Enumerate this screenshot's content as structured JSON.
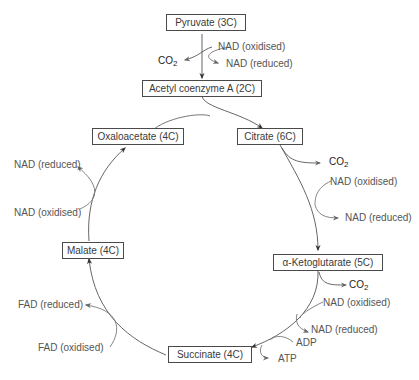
{
  "diagram": {
    "nodes": {
      "pyruvate": "Pyruvate (3C)",
      "acetyl_coa": "Acetyl coenzyme A (2C)",
      "citrate": "Citrate (6C)",
      "ketoglutarate": "α-Ketoglutarate (5C)",
      "succinate": "Succinate (4C)",
      "malate": "Malate (4C)",
      "oxaloacetate": "Oxaloacetate (4C)"
    },
    "labels": {
      "pyr_nad_ox": "NAD (oxidised)",
      "pyr_nad_red": "NAD (reduced)",
      "pyr_co2": "CO",
      "cit_co2": "CO",
      "cit_nad_ox": "NAD (oxidised)",
      "cit_nad_red": "NAD (reduced)",
      "keto_co2": "CO",
      "keto_nad_ox": "NAD (oxidised)",
      "keto_nad_red": "NAD (reduced)",
      "adp": "ADP",
      "atp": "ATP",
      "fad_red": "FAD (reduced)",
      "fad_ox": "FAD (oxidised)",
      "mal_nad_red": "NAD (reduced)",
      "mal_nad_ox": "NAD (oxidised)",
      "subscript_2": "2"
    },
    "colors": {
      "line": "#444444",
      "text": "#555555",
      "box_border": "#4a4a4a"
    }
  }
}
